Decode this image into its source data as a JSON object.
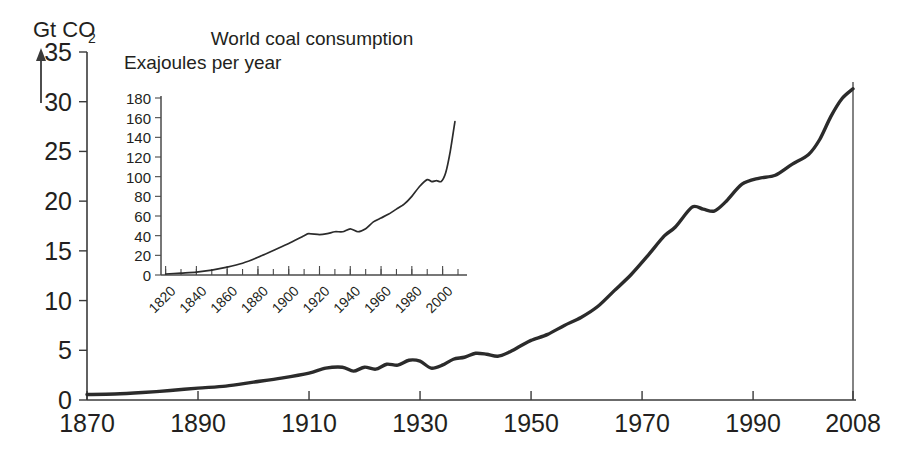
{
  "chart_data": [
    {
      "id": "main",
      "type": "line",
      "title": "",
      "xlabel": "",
      "ylabel": "Gt CO2",
      "ylabel_display": "Gt CO",
      "ylabel_subscript": "2",
      "xlim": [
        1870,
        2008
      ],
      "ylim": [
        0,
        35
      ],
      "grid": false,
      "legend": "none",
      "yticks": [
        0,
        5,
        10,
        15,
        20,
        25,
        30,
        35
      ],
      "ytick_labels": [
        "0",
        "5",
        "10",
        "15",
        "20",
        "25",
        "30",
        "35"
      ],
      "xticks": [
        1870,
        1890,
        1910,
        1930,
        1950,
        1970,
        1990,
        2008
      ],
      "xtick_labels": [
        "1870",
        "1890",
        "1910",
        "1930",
        "1950",
        "1970",
        "1990",
        "2008"
      ],
      "series": [
        {
          "name": "Global CO2 emissions",
          "units": "Gt CO2 per year",
          "x": [
            1870,
            1875,
            1880,
            1885,
            1890,
            1895,
            1900,
            1905,
            1910,
            1913,
            1916,
            1918,
            1920,
            1922,
            1924,
            1926,
            1928,
            1930,
            1932,
            1934,
            1936,
            1938,
            1940,
            1942,
            1944,
            1946,
            1948,
            1950,
            1953,
            1956,
            1959,
            1962,
            1965,
            1968,
            1971,
            1974,
            1976,
            1979,
            1981,
            1983,
            1985,
            1988,
            1991,
            1994,
            1997,
            2000,
            2002,
            2004,
            2006,
            2008
          ],
          "y": [
            0.55,
            0.6,
            0.75,
            0.95,
            1.2,
            1.4,
            1.8,
            2.2,
            2.7,
            3.2,
            3.3,
            2.9,
            3.3,
            3.1,
            3.6,
            3.5,
            4.0,
            3.9,
            3.2,
            3.5,
            4.1,
            4.3,
            4.7,
            4.6,
            4.4,
            4.8,
            5.4,
            6.0,
            6.6,
            7.5,
            8.3,
            9.4,
            11.0,
            12.6,
            14.5,
            16.5,
            17.4,
            19.4,
            19.2,
            19.0,
            19.9,
            21.7,
            22.3,
            22.6,
            23.7,
            24.7,
            26.2,
            28.5,
            30.3,
            31.3
          ]
        }
      ]
    },
    {
      "id": "inset",
      "type": "line",
      "title": "World coal consumption",
      "subtitle": "Exajoules per year",
      "xlabel": "",
      "ylabel": "Exajoules per year",
      "xlim": [
        1817,
        2010
      ],
      "ylim": [
        0,
        180
      ],
      "grid": false,
      "legend": "none",
      "yticks": [
        0,
        20,
        40,
        60,
        80,
        100,
        120,
        140,
        160,
        180
      ],
      "ytick_labels": [
        "0",
        "20",
        "40",
        "60",
        "80",
        "100",
        "120",
        "140",
        "160",
        "180"
      ],
      "xticks": [
        1820,
        1840,
        1860,
        1880,
        1900,
        1920,
        1940,
        1960,
        1980,
        2000
      ],
      "xtick_labels": [
        "1820",
        "1840",
        "1860",
        "1880",
        "1900",
        "1920",
        "1940",
        "1960",
        "1980",
        "2000"
      ],
      "xminor_interval": 10,
      "series": [
        {
          "name": "World coal consumption",
          "units": "Exajoules per year",
          "x": [
            1820,
            1830,
            1840,
            1850,
            1860,
            1870,
            1880,
            1890,
            1900,
            1910,
            1913,
            1920,
            1925,
            1930,
            1935,
            1940,
            1945,
            1950,
            1955,
            1960,
            1965,
            1970,
            1975,
            1980,
            1985,
            1990,
            1993,
            1996,
            1999,
            2002,
            2005,
            2008
          ],
          "y": [
            1,
            2,
            3,
            5,
            8,
            12,
            18,
            25,
            32,
            40,
            42,
            41,
            42,
            44,
            44,
            47,
            44,
            47,
            54,
            58,
            62,
            67,
            72,
            80,
            90,
            97,
            95,
            96,
            95,
            104,
            126,
            156
          ]
        }
      ]
    }
  ],
  "main_axis": {
    "unit_label": "Gt CO",
    "unit_subscript": "2"
  },
  "inset_axis": {
    "title": "World coal consumption",
    "subtitle": "Exajoules per year"
  },
  "colors": {
    "series_line": "#2b2b2b",
    "axis": "#3a3a3a",
    "text": "#231f20",
    "background": "#ffffff"
  }
}
